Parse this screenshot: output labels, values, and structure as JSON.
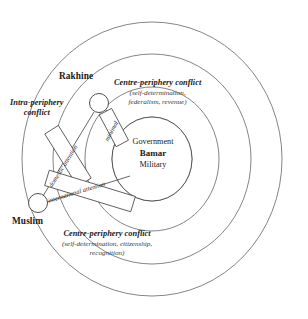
{
  "diagram": {
    "core": {
      "line1": "Government",
      "line2": "Bamar",
      "line3": "Military"
    },
    "nodes": [
      {
        "id": "rakhine",
        "label": "Rakhine"
      },
      {
        "id": "muslim",
        "label": "Muslim"
      }
    ],
    "annotations": {
      "intra_periphery": {
        "line1": "Intra-periphery",
        "line2": "conflict"
      },
      "centre_periphery_top": {
        "heading": "Centre-periphery conflict",
        "sub_line1": "(self-determination,",
        "sub_line2": "federalism, revenue)"
      },
      "centre_periphery_bottom": {
        "heading": "Centre-periphery conflict",
        "sub_line1": "(self-determination, citizenship,",
        "sub_line2": "recognition)"
      }
    },
    "bands": [
      {
        "id": "domestic-attention",
        "label": "domestic attention"
      },
      {
        "id": "international-attention",
        "label": "international attention"
      },
      {
        "id": "minimal",
        "label": "minimal"
      }
    ],
    "colors": {
      "background": "#ffffff",
      "ring_stroke": "#6e6e72",
      "core_stroke": "#4a4a4e",
      "text": "#1a1a1a"
    }
  }
}
